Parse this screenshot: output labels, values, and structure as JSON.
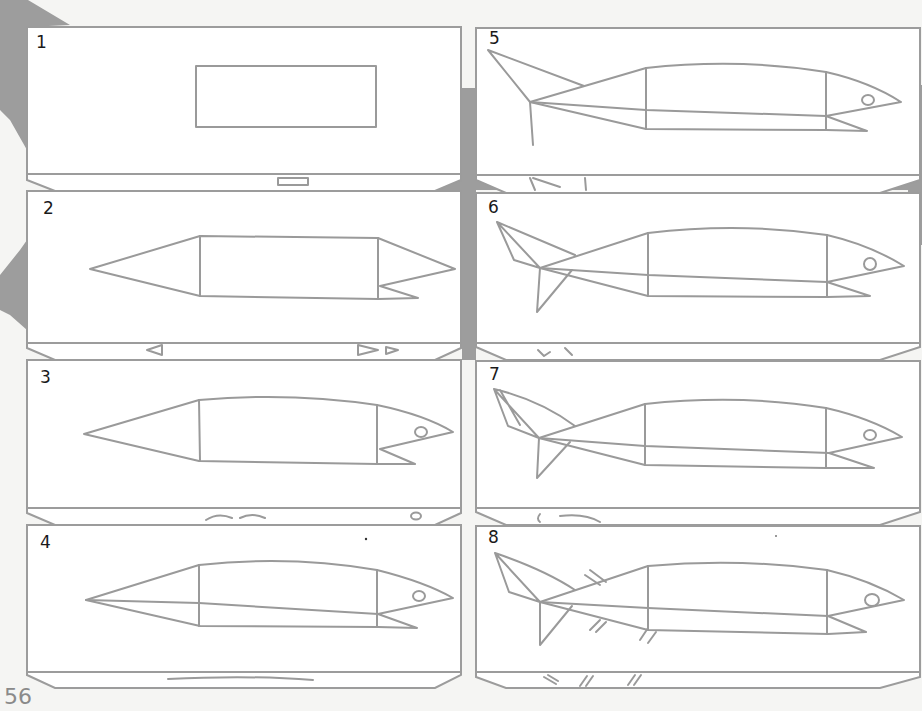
{
  "page": {
    "page_number": "56",
    "colors": {
      "line": "#9a9a9a",
      "background_shape": "#9d9d9d",
      "paper": "#ffffff",
      "step_number": "#1a1a1a"
    }
  },
  "panels": [
    {
      "step": "1",
      "x": 27,
      "y": 27,
      "w": 434,
      "h": 147,
      "col": "left"
    },
    {
      "step": "2",
      "x": 27,
      "y": 191,
      "w": 434,
      "h": 152,
      "col": "left"
    },
    {
      "step": "3",
      "x": 27,
      "y": 360,
      "w": 434,
      "h": 148,
      "col": "left"
    },
    {
      "step": "4",
      "x": 27,
      "y": 525,
      "w": 434,
      "h": 147,
      "col": "left"
    },
    {
      "step": "5",
      "x": 476,
      "y": 28,
      "w": 444,
      "h": 147,
      "col": "right"
    },
    {
      "step": "6",
      "x": 476,
      "y": 193,
      "w": 444,
      "h": 150,
      "col": "right"
    },
    {
      "step": "7",
      "x": 476,
      "y": 361,
      "w": 444,
      "h": 147,
      "col": "right"
    },
    {
      "step": "8",
      "x": 476,
      "y": 526,
      "w": 444,
      "h": 146,
      "col": "right"
    }
  ]
}
